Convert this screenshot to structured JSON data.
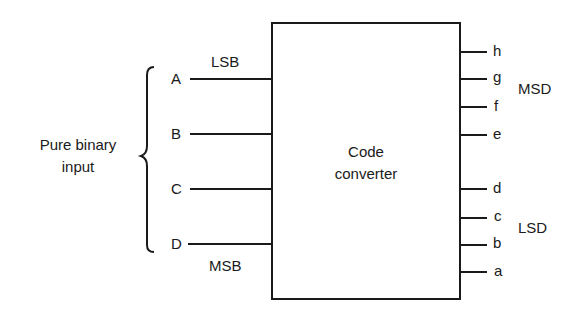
{
  "diagram": {
    "block": {
      "line1": "Code",
      "line2": "converter"
    },
    "input_group": {
      "line1": "Pure binary",
      "line2": "input"
    },
    "inputs": [
      {
        "label": "A",
        "y": 79
      },
      {
        "label": "B",
        "y": 134
      },
      {
        "label": "C",
        "y": 189
      },
      {
        "label": "D",
        "y": 244
      }
    ],
    "input_annotations": {
      "top": "LSB",
      "bottom": "MSB"
    },
    "outputs": [
      {
        "label": "h",
        "y": 52
      },
      {
        "label": "g",
        "y": 79
      },
      {
        "label": "f",
        "y": 107
      },
      {
        "label": "e",
        "y": 135
      },
      {
        "label": "d",
        "y": 189
      },
      {
        "label": "c",
        "y": 218
      },
      {
        "label": "b",
        "y": 245
      },
      {
        "label": "a",
        "y": 272
      }
    ],
    "output_groups": {
      "upper": "MSD",
      "lower": "LSD"
    },
    "colors": {
      "line": "#1a1a1a",
      "background": "#ffffff"
    }
  }
}
